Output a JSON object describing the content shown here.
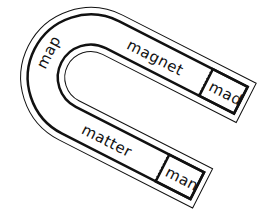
{
  "illustration": {
    "subject": "horseshoe magnet word sort",
    "words": {
      "left_arc": "map",
      "top_arm": "magnet",
      "top_tip": "mad",
      "bottom_arm": "matter",
      "bottom_tip": "man"
    },
    "colors": {
      "ink": "#111111",
      "background": "#ffffff"
    }
  }
}
